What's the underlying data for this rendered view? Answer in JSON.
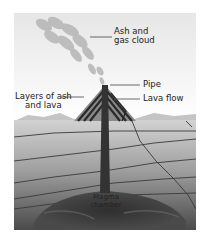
{
  "diagram": {
    "labels": {
      "ash_cloud_line1": "Ash and",
      "ash_cloud_line2": "gas cloud",
      "pipe": "Pipe",
      "layers_line1": "Layers of ash",
      "layers_line2": "and lava",
      "lava_flow": "Lava flow",
      "magma_line1": "Magma",
      "magma_line2": "chamber"
    },
    "colors": {
      "sky_top": "#e8e8e8",
      "sky_bottom": "#ffffff",
      "ground_light": "#c8c8c8",
      "ground_dark": "#4a4a4a",
      "pipe": "#333333",
      "lines": "#3a3a3a"
    }
  }
}
